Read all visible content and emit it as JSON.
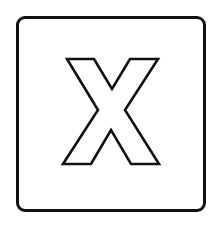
{
  "icon": {
    "name": "close-x",
    "glyph": "X",
    "style": "outlined",
    "colors": {
      "stroke": "#111111",
      "fill": "#ffffff",
      "background": "#ffffff"
    }
  }
}
